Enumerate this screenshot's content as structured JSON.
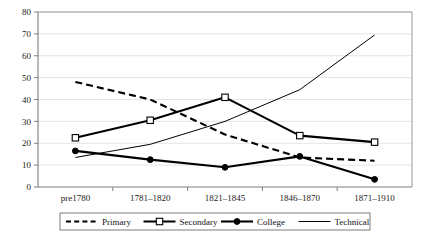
{
  "chart_data": {
    "type": "line",
    "title": "",
    "subtitle": "",
    "xlabel": "",
    "ylabel": "",
    "categories": [
      "pre1780",
      "1781–1820",
      "1821–1845",
      "1846–1870",
      "1871–1910"
    ],
    "ylim": [
      0,
      80
    ],
    "yticks": [
      0,
      10,
      20,
      30,
      40,
      50,
      60,
      70,
      80
    ],
    "ytick_labels": [
      "0",
      "10",
      "20",
      "30",
      "40",
      "50",
      "60",
      "70",
      "80"
    ],
    "grid": "horizontal",
    "legend_position": "bottom",
    "series": [
      {
        "name": "Primary",
        "values": [
          48,
          40,
          24,
          13.5,
          12
        ],
        "style": "dashed",
        "marker": "none",
        "color": "#000000",
        "line_width": 2.1
      },
      {
        "name": "Secondary",
        "values": [
          22.5,
          30.5,
          41,
          23.5,
          20.5
        ],
        "style": "solid",
        "marker": "open-square",
        "color": "#000000",
        "line_width": 2.1
      },
      {
        "name": "College",
        "values": [
          16.5,
          12.5,
          9,
          14,
          3.5
        ],
        "style": "solid",
        "marker": "filled-circle",
        "color": "#000000",
        "line_width": 2.1
      },
      {
        "name": "Technical",
        "values": [
          13.5,
          19.5,
          30,
          44.5,
          69.5
        ],
        "style": "solid",
        "marker": "none",
        "color": "#000000",
        "line_width": 1.0
      }
    ],
    "legend_entries": [
      {
        "label": "Primary",
        "style": "dashed",
        "marker": "none"
      },
      {
        "label": "Secondary",
        "style": "solid",
        "marker": "open-square"
      },
      {
        "label": "College",
        "style": "solid",
        "marker": "filled-circle"
      },
      {
        "label": "Technical",
        "style": "solid",
        "marker": "none"
      }
    ]
  },
  "colors": {
    "series": "#000000",
    "grid": "#d9d9d9",
    "axis": "#808080",
    "plot_background": "#ffffff",
    "legend_border": "#5a5a5a"
  }
}
